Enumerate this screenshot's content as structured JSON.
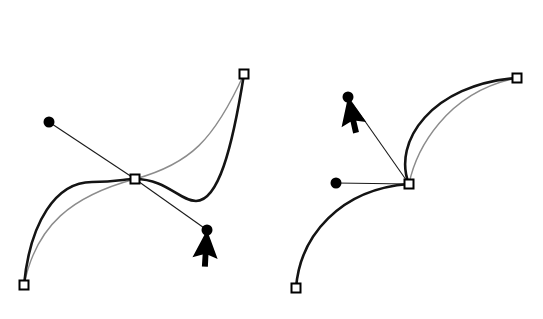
{
  "canvas": {
    "width": 543,
    "height": 319,
    "background": "#ffffff",
    "title": "Bezier curve handle manipulation"
  },
  "style": {
    "original_curve_color": "#8c8c8c",
    "original_curve_width": 1.4,
    "edited_curve_color": "#141414",
    "edited_curve_width": 2.6,
    "handle_line_color": "#1a1a1a",
    "handle_line_width": 1.1,
    "anchor_stroke": "#000000",
    "anchor_fill": "#ffffff",
    "anchor_size": 9,
    "anchor_stroke_width": 2,
    "control_dot_color": "#000000",
    "control_dot_radius": 5.5,
    "cursor_color": "#000000"
  },
  "caption": {
    "text": ""
  },
  "figures": [
    {
      "id": "left-figure",
      "name": "s-curve-handle-drag",
      "anchors": [
        {
          "name": "anchor-bottom-left",
          "x": 24,
          "y": 285
        },
        {
          "name": "anchor-center",
          "x": 135,
          "y": 179
        },
        {
          "name": "anchor-top-right",
          "x": 244,
          "y": 74
        }
      ],
      "control_points": [
        {
          "name": "control-point-incoming",
          "x": 49,
          "y": 122
        },
        {
          "name": "control-point-outgoing",
          "x": 207,
          "y": 230
        }
      ],
      "handles": [
        {
          "name": "handle-line-incoming",
          "x1": 49,
          "y1": 122,
          "x2": 135,
          "y2": 179
        },
        {
          "name": "handle-line-outgoing",
          "x1": 135,
          "y1": 179,
          "x2": 207,
          "y2": 230
        }
      ],
      "original_curve": "M24,285 C36,225 72,196 135,179 C190,164 214,140 244,74",
      "edited_curve": "M24,285 C30,222 56,182 92,182 C118,182 124,179 135,179 C166,179 180,201 196,201 C218,201 232,150 244,74",
      "cursor": {
        "name": "mouse-cursor",
        "tip_x": 207,
        "tip_y": 230,
        "rotation": 28
      }
    },
    {
      "id": "right-figure",
      "name": "corner-handle-drag",
      "anchors": [
        {
          "name": "anchor-bottom-left",
          "x": 296,
          "y": 288
        },
        {
          "name": "anchor-center",
          "x": 409,
          "y": 184
        },
        {
          "name": "anchor-top-right",
          "x": 517,
          "y": 78
        }
      ],
      "control_points": [
        {
          "name": "control-point-incoming",
          "x": 336,
          "y": 183
        },
        {
          "name": "control-point-outgoing",
          "x": 348,
          "y": 97
        }
      ],
      "handles": [
        {
          "name": "handle-line-incoming",
          "x1": 336,
          "y1": 183,
          "x2": 409,
          "y2": 184
        },
        {
          "name": "handle-line-outgoing",
          "x1": 409,
          "y1": 184,
          "x2": 348,
          "y2": 97
        }
      ],
      "original_curve": "M409,184 C416,150 446,92 517,78",
      "edited_curve_lower": "M296,288 C300,236 340,189 409,184",
      "edited_curve_upper": "M409,184 C392,142 432,84 517,78",
      "cursor": {
        "name": "mouse-cursor",
        "tip_x": 348,
        "tip_y": 97,
        "rotation": 12
      }
    }
  ]
}
